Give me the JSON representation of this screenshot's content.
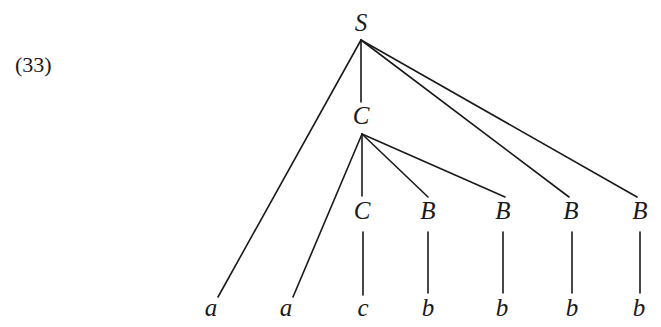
{
  "example_number": "(33)",
  "tree": {
    "nodes": [
      {
        "id": "S",
        "label": "S",
        "x": 361,
        "y": 31,
        "size": 25
      },
      {
        "id": "C1",
        "label": "C",
        "x": 361,
        "y": 124,
        "size": 25
      },
      {
        "id": "C2",
        "label": "C",
        "x": 362,
        "y": 219,
        "size": 25
      },
      {
        "id": "B1",
        "label": "B",
        "x": 428,
        "y": 219,
        "size": 25
      },
      {
        "id": "B2",
        "label": "B",
        "x": 503,
        "y": 219,
        "size": 25
      },
      {
        "id": "B3",
        "label": "B",
        "x": 571,
        "y": 219,
        "size": 25
      },
      {
        "id": "B4",
        "label": "B",
        "x": 640,
        "y": 219,
        "size": 25
      },
      {
        "id": "a1",
        "label": "a",
        "x": 211,
        "y": 316,
        "size": 25
      },
      {
        "id": "a2",
        "label": "a",
        "x": 286,
        "y": 316,
        "size": 25
      },
      {
        "id": "c1",
        "label": "c",
        "x": 363,
        "y": 316,
        "size": 25
      },
      {
        "id": "b1",
        "label": "b",
        "x": 428,
        "y": 316,
        "size": 25
      },
      {
        "id": "b2",
        "label": "b",
        "x": 502,
        "y": 316,
        "size": 25
      },
      {
        "id": "b3",
        "label": "b",
        "x": 572,
        "y": 316,
        "size": 25
      },
      {
        "id": "b4",
        "label": "b",
        "x": 639,
        "y": 316,
        "size": 25
      }
    ],
    "edges": [
      {
        "from": "S",
        "to": "a1",
        "x1": 361,
        "y1": 40,
        "x2": 218,
        "y2": 297
      },
      {
        "from": "S",
        "to": "C1",
        "x1": 361,
        "y1": 40,
        "x2": 361,
        "y2": 102
      },
      {
        "from": "S",
        "to": "B3",
        "x1": 361,
        "y1": 40,
        "x2": 569,
        "y2": 197
      },
      {
        "from": "S",
        "to": "B4",
        "x1": 361,
        "y1": 40,
        "x2": 637,
        "y2": 197
      },
      {
        "from": "C1",
        "to": "a2",
        "x1": 362,
        "y1": 134,
        "x2": 293,
        "y2": 297
      },
      {
        "from": "C1",
        "to": "C2",
        "x1": 362,
        "y1": 134,
        "x2": 362,
        "y2": 196
      },
      {
        "from": "C1",
        "to": "B1",
        "x1": 362,
        "y1": 134,
        "x2": 428,
        "y2": 197
      },
      {
        "from": "C1",
        "to": "B2",
        "x1": 362,
        "y1": 134,
        "x2": 505,
        "y2": 197
      },
      {
        "from": "C2",
        "to": "c1",
        "x1": 363,
        "y1": 232,
        "x2": 363,
        "y2": 295
      },
      {
        "from": "B1",
        "to": "b1",
        "x1": 428,
        "y1": 232,
        "x2": 428,
        "y2": 293
      },
      {
        "from": "B2",
        "to": "b2",
        "x1": 503,
        "y1": 232,
        "x2": 503,
        "y2": 293
      },
      {
        "from": "B3",
        "to": "b3",
        "x1": 572,
        "y1": 232,
        "x2": 572,
        "y2": 293
      },
      {
        "from": "B4",
        "to": "b4",
        "x1": 640,
        "y1": 232,
        "x2": 640,
        "y2": 293
      }
    ]
  }
}
